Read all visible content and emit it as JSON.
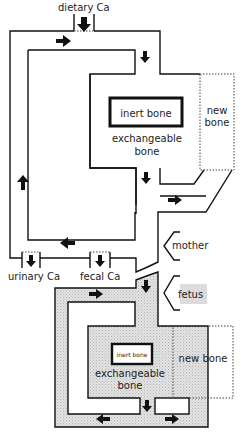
{
  "diagram": {
    "colors": {
      "line": "#111111",
      "fetal_fill": "#dcdcdc",
      "background": "#ffffff"
    },
    "maternal": {
      "input_label": "dietary Ca",
      "inert_label": "inert bone",
      "exchangeable_label_1": "exchangeable",
      "exchangeable_label_2": "bone",
      "new_bone_label_1": "new",
      "new_bone_label_2": "bone",
      "output_urinary": "urinary Ca",
      "output_fecal": "fecal Ca",
      "side_label": "mother"
    },
    "fetal": {
      "side_label": "fetus",
      "inert_label": "inert bone",
      "exchangeable_label_1": "exchangeable",
      "exchangeable_label_2": "bone",
      "new_bone_label": "new bone"
    }
  }
}
